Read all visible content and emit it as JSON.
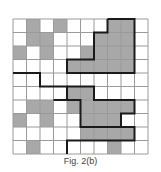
{
  "figure": {
    "caption": "Fig. 2(b)",
    "grid": {
      "rows": 10,
      "cols": 10,
      "origin_x": 13,
      "origin_y": 19,
      "cell_size": 13.5,
      "shaded_color": "#a8a8a8",
      "line_color": "#9a9a9a",
      "thick_color": "#1a1a1a",
      "shaded": [
        [
          1,
          3,
          7,
          8
        ],
        [
          1,
          2,
          6,
          7,
          8
        ],
        [
          0,
          2,
          5,
          6,
          7,
          8
        ],
        [
          4,
          5,
          6,
          7,
          8
        ],
        [],
        [
          4,
          5
        ],
        [
          1,
          2,
          4,
          5,
          6,
          7,
          8
        ],
        [
          0,
          2,
          5,
          6,
          7
        ],
        [
          5,
          6,
          7,
          8
        ],
        [
          1,
          7
        ]
      ],
      "thick_paths": [
        [
          [
            7,
            0
          ],
          [
            9,
            0
          ],
          [
            9,
            4
          ],
          [
            4,
            4
          ],
          [
            4,
            3
          ],
          [
            6,
            3
          ],
          [
            6,
            1
          ],
          [
            7,
            1
          ],
          [
            7,
            0
          ]
        ],
        [
          [
            0,
            4
          ],
          [
            2,
            4
          ],
          [
            2,
            5
          ],
          [
            4,
            5
          ],
          [
            4,
            6
          ],
          [
            3,
            6
          ]
        ],
        [
          [
            4,
            5
          ],
          [
            6,
            5
          ],
          [
            6,
            6
          ],
          [
            9,
            6
          ],
          [
            9,
            7
          ],
          [
            8,
            7
          ],
          [
            8,
            8
          ],
          [
            9,
            8
          ],
          [
            9,
            9
          ],
          [
            4,
            9
          ],
          [
            4,
            10
          ]
        ],
        [
          [
            4,
            6
          ],
          [
            5,
            6
          ],
          [
            5,
            8
          ],
          [
            8,
            8
          ]
        ]
      ]
    }
  }
}
